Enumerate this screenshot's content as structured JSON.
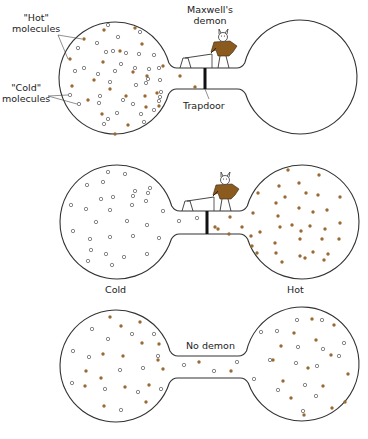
{
  "labels": {
    "hot_molecules": "\"Hot\"\nmolecules",
    "hot_molecules_l1": "\"Hot\"",
    "hot_molecules_l2": "molecules",
    "cold_molecules_l1": "\"Cold\"",
    "cold_molecules_l2": "molecules",
    "demon_l1": "Maxwell's",
    "demon_l2": "demon",
    "trapdoor": "Trapdoor",
    "cold": "Cold",
    "hot": "Hot",
    "no_demon": "No demon"
  },
  "colors": {
    "hot_molecule": "#9a6a35",
    "cold_molecule_stroke": "#555555",
    "vessel_stroke": "#333333",
    "demon_coat": "#8b5a1e",
    "trapdoor": "#111111"
  },
  "panels": [
    {
      "id": "initial",
      "left": {
        "cx": 115,
        "cy": 78,
        "r": 56
      },
      "right": {
        "cx": 300,
        "cy": 77,
        "r": 57
      },
      "tube": {
        "y1": 68,
        "y2": 89
      },
      "demon": true,
      "hot": [
        [
          84,
          39
        ],
        [
          104,
          30
        ],
        [
          135,
          28
        ],
        [
          142,
          44
        ],
        [
          120,
          51
        ],
        [
          103,
          62
        ],
        [
          94,
          80
        ],
        [
          70,
          59
        ],
        [
          133,
          72
        ],
        [
          147,
          76
        ],
        [
          163,
          66
        ],
        [
          110,
          89
        ],
        [
          88,
          100
        ],
        [
          126,
          96
        ],
        [
          145,
          96
        ],
        [
          157,
          93
        ],
        [
          72,
          86
        ],
        [
          128,
          125
        ],
        [
          102,
          114
        ],
        [
          115,
          134
        ],
        [
          146,
          107
        ],
        [
          159,
          106
        ],
        [
          180,
          76
        ],
        [
          195,
          87
        ]
      ],
      "cold": [
        [
          108,
          25
        ],
        [
          140,
          32
        ],
        [
          97,
          43
        ],
        [
          118,
          37
        ],
        [
          78,
          48
        ],
        [
          106,
          52
        ],
        [
          113,
          51
        ],
        [
          126,
          53
        ],
        [
          139,
          54
        ],
        [
          154,
          55
        ],
        [
          159,
          68
        ],
        [
          121,
          64
        ],
        [
          115,
          71
        ],
        [
          135,
          68
        ],
        [
          149,
          69
        ],
        [
          148,
          79
        ],
        [
          75,
          71
        ],
        [
          84,
          68
        ],
        [
          98,
          74
        ],
        [
          110,
          82
        ],
        [
          136,
          85
        ],
        [
          160,
          80
        ],
        [
          100,
          96
        ],
        [
          99,
          103
        ],
        [
          146,
          83
        ],
        [
          161,
          92
        ],
        [
          70,
          95
        ],
        [
          79,
          104
        ],
        [
          123,
          100
        ],
        [
          133,
          104
        ],
        [
          108,
          119
        ],
        [
          117,
          113
        ],
        [
          141,
          114
        ],
        [
          154,
          110
        ],
        [
          104,
          124
        ],
        [
          159,
          101
        ],
        [
          144,
          122
        ],
        [
          160,
          97
        ]
      ]
    },
    {
      "id": "sorted",
      "left": {
        "cx": 117,
        "cy": 222,
        "r": 57
      },
      "right": {
        "cx": 302,
        "cy": 222,
        "r": 57
      },
      "tube": {
        "y1": 211,
        "y2": 234
      },
      "demon": true,
      "hot": [
        [
          288,
          170
        ],
        [
          319,
          175
        ],
        [
          279,
          186
        ],
        [
          299,
          183
        ],
        [
          258,
          193
        ],
        [
          285,
          197
        ],
        [
          306,
          193
        ],
        [
          318,
          195
        ],
        [
          340,
          197
        ],
        [
          253,
          213
        ],
        [
          276,
          203
        ],
        [
          299,
          208
        ],
        [
          313,
          212
        ],
        [
          327,
          210
        ],
        [
          230,
          217
        ],
        [
          278,
          216
        ],
        [
          292,
          225
        ],
        [
          310,
          226
        ],
        [
          340,
          223
        ],
        [
          218,
          229
        ],
        [
          242,
          227
        ],
        [
          251,
          236
        ],
        [
          260,
          232
        ],
        [
          280,
          227
        ],
        [
          301,
          231
        ],
        [
          325,
          229
        ],
        [
          252,
          246
        ],
        [
          275,
          243
        ],
        [
          300,
          239
        ],
        [
          322,
          239
        ],
        [
          339,
          239
        ],
        [
          257,
          253
        ],
        [
          276,
          253
        ],
        [
          300,
          256
        ],
        [
          313,
          252
        ],
        [
          328,
          254
        ],
        [
          282,
          262
        ],
        [
          305,
          258
        ],
        [
          324,
          260
        ],
        [
          215,
          227
        ],
        [
          229,
          234
        ]
      ],
      "cold": [
        [
          108,
          172
        ],
        [
          125,
          174
        ],
        [
          87,
          185
        ],
        [
          103,
          182
        ],
        [
          150,
          188
        ],
        [
          135,
          191
        ],
        [
          101,
          199
        ],
        [
          113,
          197
        ],
        [
          133,
          196
        ],
        [
          148,
          193
        ],
        [
          71,
          205
        ],
        [
          86,
          209
        ],
        [
          110,
          210
        ],
        [
          132,
          205
        ],
        [
          146,
          201
        ],
        [
          163,
          211
        ],
        [
          96,
          222
        ],
        [
          127,
          221
        ],
        [
          147,
          225
        ],
        [
          73,
          231
        ],
        [
          90,
          239
        ],
        [
          110,
          237
        ],
        [
          133,
          236
        ],
        [
          159,
          238
        ],
        [
          91,
          250
        ],
        [
          106,
          254
        ],
        [
          147,
          254
        ],
        [
          88,
          261
        ],
        [
          124,
          257
        ],
        [
          112,
          265
        ],
        [
          179,
          221
        ],
        [
          197,
          218
        ]
      ]
    },
    {
      "id": "equilibrium",
      "left": {
        "cx": 116,
        "cy": 366,
        "r": 56
      },
      "right": {
        "cx": 302,
        "cy": 364,
        "r": 57
      },
      "tube": {
        "y1": 356,
        "y2": 378
      },
      "demon": false,
      "hot": [
        [
          110,
          317
        ],
        [
          121,
          326
        ],
        [
          140,
          322
        ],
        [
          142,
          343
        ],
        [
          159,
          344
        ],
        [
          103,
          354
        ],
        [
          123,
          356
        ],
        [
          86,
          371
        ],
        [
          101,
          378
        ],
        [
          158,
          360
        ],
        [
          85,
          386
        ],
        [
          125,
          387
        ],
        [
          149,
          385
        ],
        [
          163,
          369
        ],
        [
          104,
          406
        ],
        [
          146,
          402
        ],
        [
          199,
          362
        ],
        [
          231,
          371
        ],
        [
          273,
          360
        ],
        [
          283,
          381
        ],
        [
          312,
          319
        ],
        [
          294,
          333
        ],
        [
          281,
          346
        ],
        [
          316,
          340
        ],
        [
          334,
          325
        ],
        [
          308,
          368
        ],
        [
          331,
          355
        ],
        [
          348,
          374
        ],
        [
          323,
          386
        ],
        [
          291,
          398
        ],
        [
          304,
          415
        ],
        [
          332,
          408
        ],
        [
          345,
          402
        ]
      ],
      "cold": [
        [
          92,
          329
        ],
        [
          108,
          339
        ],
        [
          132,
          334
        ],
        [
          154,
          334
        ],
        [
          73,
          351
        ],
        [
          89,
          357
        ],
        [
          158,
          356
        ],
        [
          120,
          370
        ],
        [
          143,
          368
        ],
        [
          72,
          383
        ],
        [
          105,
          389
        ],
        [
          138,
          392
        ],
        [
          161,
          389
        ],
        [
          121,
          410
        ],
        [
          184,
          365
        ],
        [
          214,
          371
        ],
        [
          237,
          362
        ],
        [
          254,
          379
        ],
        [
          261,
          332
        ],
        [
          277,
          331
        ],
        [
          297,
          320
        ],
        [
          322,
          320
        ],
        [
          298,
          347
        ],
        [
          323,
          349
        ],
        [
          344,
          343
        ],
        [
          339,
          356
        ],
        [
          270,
          360
        ],
        [
          296,
          363
        ],
        [
          317,
          366
        ],
        [
          278,
          390
        ],
        [
          305,
          385
        ],
        [
          316,
          396
        ],
        [
          303,
          411
        ]
      ]
    }
  ]
}
